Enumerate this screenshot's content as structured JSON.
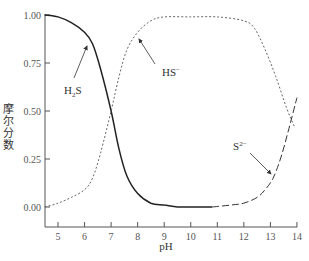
{
  "chart_data": {
    "type": "line",
    "title": "",
    "xlabel": "pH",
    "ylabel": "摩尔分数",
    "xlim": [
      4.5,
      14
    ],
    "ylim": [
      -0.1,
      1.0
    ],
    "grid": false,
    "legend": "none (inline annotations with arrows)",
    "x_ticks": [
      "5",
      "6",
      "7",
      "8",
      "9",
      "10",
      "11",
      "12",
      "13",
      "14"
    ],
    "y_ticks": [
      "0.00",
      "0.25",
      "0.50",
      "0.75",
      "1.00"
    ],
    "series": [
      {
        "name": "H₂S",
        "style": "solid",
        "x": [
          4.5,
          5.0,
          5.5,
          6.0,
          6.3,
          6.6,
          7.0,
          7.3,
          7.6,
          8.0,
          8.5,
          9.0,
          9.5,
          10.0,
          10.8
        ],
        "values": [
          1.0,
          0.99,
          0.96,
          0.91,
          0.85,
          0.72,
          0.5,
          0.3,
          0.16,
          0.07,
          0.02,
          0.01,
          0.0,
          0.0,
          0.0
        ]
      },
      {
        "name": "HS⁻",
        "style": "dotted",
        "x": [
          4.5,
          5.0,
          5.5,
          6.0,
          6.3,
          6.6,
          7.0,
          7.3,
          7.6,
          8.0,
          8.5,
          9.0,
          10.0,
          11.0,
          12.0,
          12.4,
          12.8,
          13.2,
          13.6,
          13.9
        ],
        "values": [
          0.0,
          0.02,
          0.05,
          0.09,
          0.15,
          0.28,
          0.5,
          0.68,
          0.82,
          0.91,
          0.97,
          0.99,
          0.99,
          0.99,
          0.97,
          0.93,
          0.82,
          0.68,
          0.52,
          0.42
        ]
      },
      {
        "name": "S²⁻",
        "style": "dashed",
        "x": [
          10.8,
          11.5,
          12.0,
          12.5,
          12.8,
          13.1,
          13.4,
          13.7,
          14.0
        ],
        "values": [
          0.0,
          0.01,
          0.02,
          0.05,
          0.09,
          0.15,
          0.26,
          0.41,
          0.57
        ]
      }
    ],
    "annotations": [
      {
        "text": "H₂S",
        "sub": "2",
        "arrow_to": [
          6.15,
          0.88
        ]
      },
      {
        "text": "HS⁻",
        "arrow_to": [
          8.0,
          0.88
        ]
      },
      {
        "text": "S²⁻",
        "arrow_to": [
          13.1,
          0.14
        ]
      }
    ]
  },
  "labels": {
    "xlabel": "pH",
    "ylabel": "摩尔分数",
    "ann_h2s_main": "H",
    "ann_h2s_sub": "2",
    "ann_h2s_end": "S",
    "ann_hs": "HS",
    "ann_hs_sup": "−",
    "ann_s": "S",
    "ann_s_sup": "2−"
  }
}
